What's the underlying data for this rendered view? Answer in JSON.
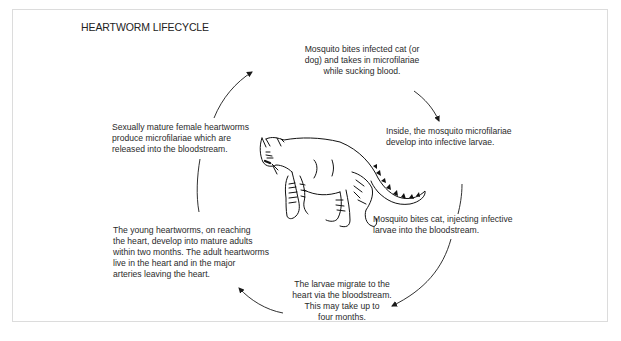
{
  "diagram": {
    "title": "HEARTWORM LIFECYCLE",
    "steps": [
      {
        "id": "mosquito-bites-infected",
        "text": "Mosquito bites infected cat (or\ndog) and takes in microfilariae\nwhile sucking blood."
      },
      {
        "id": "inside-mosquito",
        "text": "Inside, the mosquito microfilariae\ndevelop into infective larvae."
      },
      {
        "id": "mosquito-bites-cat",
        "text": "Mosquito bites cat, injecting infective\nlarvae into the bloodstream."
      },
      {
        "id": "larvae-migrate",
        "text": "The larvae migrate to the\nheart via the bloodstream.\nThis may take up to\nfour months."
      },
      {
        "id": "young-heartworms",
        "text": "The young heartworms, on reaching\nthe heart, develop into mature adults\nwithin two months. The adult heartworms\nlive in the heart and in the major\narteries leaving the heart."
      },
      {
        "id": "sexually-mature",
        "text": "Sexually mature female heartworms\nproduce microfilariae which are\nreleased into the bloodstream."
      }
    ],
    "center_image": "cat-illustration",
    "flow": "clockwise-cycle",
    "colors": {
      "text": "#2a2a2a",
      "line": "#1a1a1a",
      "border": "#dcdcdc"
    }
  }
}
